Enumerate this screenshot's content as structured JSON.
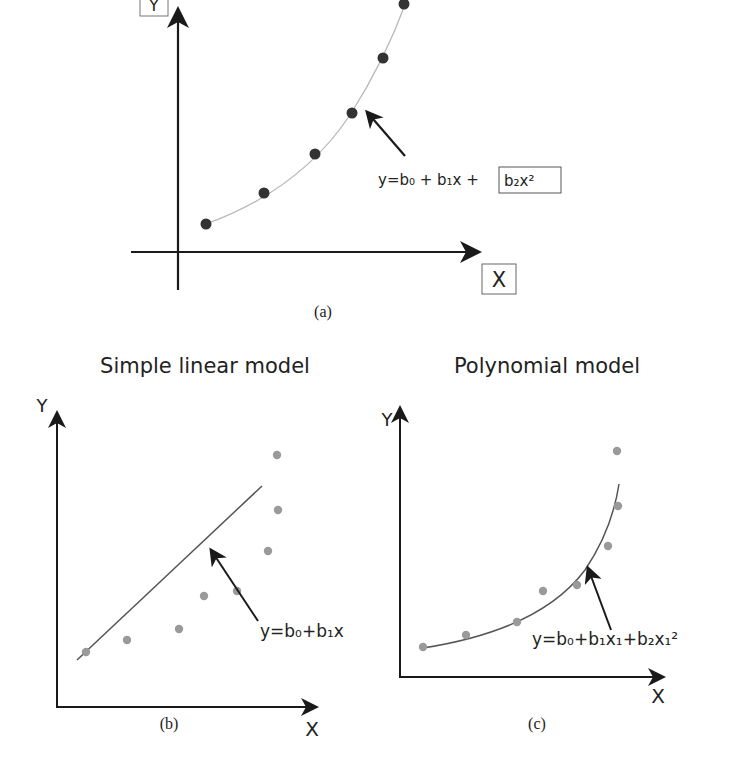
{
  "panel_a": {
    "y_label": "Y",
    "x_label": "X",
    "equation_prefix": "y=b₀ + b₁x + ",
    "equation_boxed_term": "b₂x²",
    "caption": "(a)",
    "colors": {
      "axis": "#1a1a1a",
      "curve": "#b8b8b8",
      "points": "#333333"
    },
    "points": [
      [
        206,
        224
      ],
      [
        264,
        193
      ],
      [
        315,
        154
      ],
      [
        352,
        113
      ],
      [
        383,
        58
      ],
      [
        404,
        4
      ]
    ]
  },
  "panel_b": {
    "title": "Simple linear model",
    "y_label": "Y",
    "x_label": "X",
    "equation": "y=b₀+b₁x",
    "caption": "(b)",
    "colors": {
      "axis": "#1a1a1a",
      "line": "#555555",
      "points": "#9a9a9a"
    },
    "points": [
      [
        86,
        652
      ],
      [
        127,
        640
      ],
      [
        179,
        629
      ],
      [
        204,
        596
      ],
      [
        237,
        591
      ],
      [
        268,
        551
      ],
      [
        278,
        510
      ],
      [
        277,
        455
      ]
    ]
  },
  "panel_c": {
    "title": "Polynomial model",
    "y_label": "Y",
    "x_label": "X",
    "equation": "y=b₀+b₁x₁+b₂x₁²",
    "caption": "(c)",
    "colors": {
      "axis": "#1a1a1a",
      "curve": "#555555",
      "points": "#9a9a9a"
    },
    "points": [
      [
        423,
        647
      ],
      [
        466,
        635
      ],
      [
        517,
        622
      ],
      [
        543,
        591
      ],
      [
        577,
        585
      ],
      [
        608,
        546
      ],
      [
        618,
        506
      ],
      [
        617,
        451
      ]
    ]
  }
}
